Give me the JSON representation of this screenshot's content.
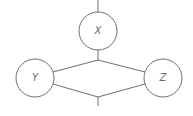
{
  "diagram": {
    "type": "graph",
    "colors": {
      "stroke": "#6e6e6e",
      "background": "#ffffff",
      "text": "#6e6e6e"
    },
    "nodes": [
      {
        "id": "X",
        "label": "X",
        "cx": 98,
        "cy": 31,
        "r": 19
      },
      {
        "id": "Y",
        "label": "Y",
        "cx": 35,
        "cy": 78,
        "r": 19
      },
      {
        "id": "Z",
        "label": "Z",
        "cx": 163,
        "cy": 78,
        "r": 19
      }
    ],
    "edges": [
      {
        "from": "top-stub",
        "to": "X"
      },
      {
        "from": "X",
        "to": "upper-junction"
      },
      {
        "from": "upper-junction",
        "to": "Y"
      },
      {
        "from": "upper-junction",
        "to": "Z"
      },
      {
        "from": "Y",
        "to": "lower-junction"
      },
      {
        "from": "Z",
        "to": "lower-junction"
      },
      {
        "from": "lower-junction",
        "to": "bottom-stub"
      }
    ]
  }
}
